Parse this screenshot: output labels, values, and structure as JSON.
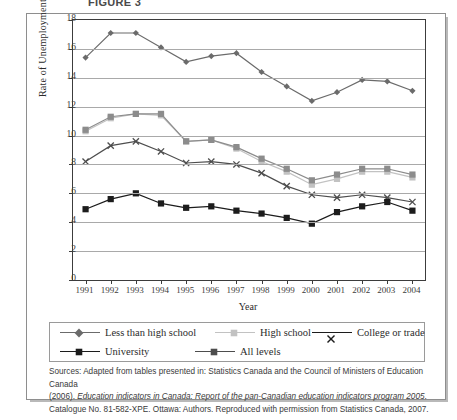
{
  "document": {
    "title_fragment": "FIGURE 3"
  },
  "chart_data": {
    "type": "line",
    "title": "",
    "xlabel": "Year",
    "ylabel": "Rate of Unemployment (%)",
    "ylim": [
      0,
      18
    ],
    "ytick_step": 2,
    "yticks": [
      0,
      2,
      4,
      6,
      8,
      10,
      12,
      14,
      16,
      18
    ],
    "grid": true,
    "legend_position": "bottom",
    "categories": [
      1991,
      1992,
      1993,
      1994,
      1995,
      1996,
      1997,
      1998,
      1999,
      2000,
      2001,
      2002,
      2003,
      2004
    ],
    "xtick_labels": [
      "1991",
      "1992",
      "1993",
      "1994",
      "1995",
      "1996",
      "1997",
      "1998",
      "1999",
      "2000",
      "2001",
      "2002",
      "2003",
      "2004"
    ],
    "series": [
      {
        "name": "Less than high school",
        "marker": "diamond",
        "color": "#6b6b6b",
        "values": [
          15.4,
          17.1,
          17.1,
          16.1,
          15.1,
          15.5,
          15.7,
          14.4,
          13.4,
          12.4,
          13.0,
          13.85,
          13.75,
          13.1
        ]
      },
      {
        "name": "High school",
        "marker": "square",
        "color": "#c2c2c2",
        "values": [
          10.3,
          11.2,
          11.5,
          11.4,
          9.6,
          9.7,
          9.1,
          8.2,
          7.5,
          6.6,
          7.0,
          7.5,
          7.5,
          7.1
        ]
      },
      {
        "name": "College or trade",
        "marker": "x",
        "color": "#4d4d4d",
        "values": [
          8.2,
          9.3,
          9.6,
          8.9,
          8.1,
          8.2,
          8.0,
          7.4,
          6.5,
          5.9,
          5.7,
          5.9,
          5.7,
          5.4
        ]
      },
      {
        "name": "University",
        "marker": "square",
        "color": "#1c1c1c",
        "values": [
          4.9,
          5.6,
          6.0,
          5.3,
          5.0,
          5.1,
          4.8,
          4.6,
          4.3,
          3.9,
          4.7,
          5.1,
          5.4,
          4.8
        ]
      },
      {
        "name": "All levels",
        "marker": "square",
        "color": "#8c8c8c",
        "values": [
          10.4,
          11.3,
          11.5,
          11.5,
          9.6,
          9.7,
          9.2,
          8.4,
          7.7,
          6.9,
          7.3,
          7.7,
          7.7,
          7.3
        ]
      }
    ]
  },
  "legend": {
    "entries": [
      {
        "label": "Less than high school",
        "marker": "diamond",
        "color": "#6b6b6b"
      },
      {
        "label": "High school",
        "marker": "square",
        "color": "#c2c2c2"
      },
      {
        "label": "College or trade",
        "marker": "x",
        "color": "#1c1c1c"
      },
      {
        "label": "University",
        "marker": "square",
        "color": "#1c1c1c"
      },
      {
        "label": "All levels",
        "marker": "square",
        "color": "#4d4d4d"
      }
    ]
  },
  "sources": {
    "line1_a": "Sources: Adapted from tables presented in: Statistics Canada and the Council of Ministers of Education Canada",
    "line2_a": "(2006). ",
    "line2_italic": "Education indicators in Canada: Report of the pan-Canadian education indicators program 2005",
    "line2_b": ".",
    "line3_a": "Catalogue No. 81-582-XPE. Ottawa: Authors. Reproduced with permission from Statistics Canada, 2007."
  }
}
